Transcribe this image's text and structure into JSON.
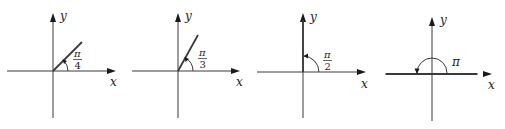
{
  "diagrams": [
    {
      "id": "pi-over-4",
      "angle_radians_label": "π/4",
      "angle_fraction_of_pi": 0.25,
      "numerator": "π",
      "denominator": "4",
      "x_label": "x",
      "y_label": "y"
    },
    {
      "id": "pi-over-3",
      "angle_radians_label": "π/3",
      "angle_fraction_of_pi": 0.3333,
      "numerator": "π",
      "denominator": "3",
      "x_label": "x",
      "y_label": "y"
    },
    {
      "id": "pi-over-2",
      "angle_radians_label": "π/2",
      "angle_fraction_of_pi": 0.5,
      "numerator": "π",
      "denominator": "2",
      "x_label": "x",
      "y_label": "y"
    },
    {
      "id": "pi",
      "angle_radians_label": "π",
      "angle_fraction_of_pi": 1.0,
      "numerator": "π",
      "denominator": "",
      "x_label": "x",
      "y_label": "y"
    }
  ]
}
